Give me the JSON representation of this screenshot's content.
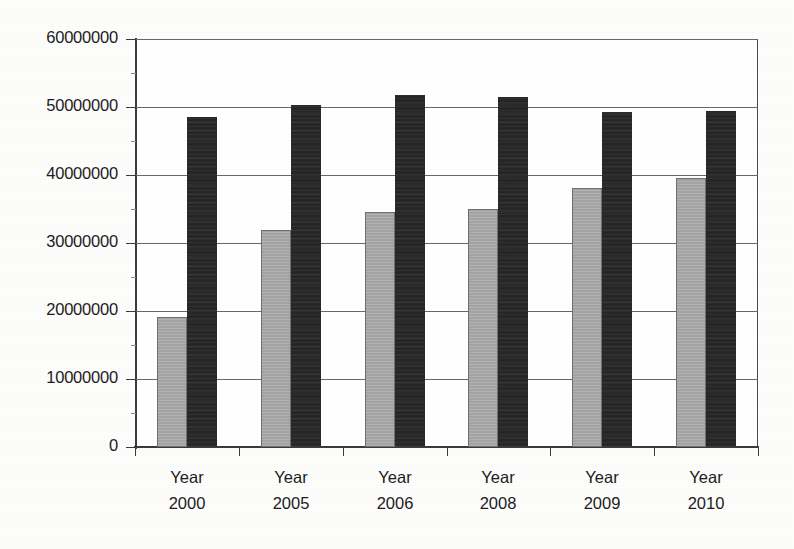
{
  "chart_data": {
    "type": "bar",
    "title": "",
    "subtitle": "",
    "xlabel": "",
    "ylabel": "",
    "categories": [
      "Year 2000",
      "Year 2005",
      "Year 2006",
      "Year 2008",
      "Year 2009",
      "Year 2010"
    ],
    "category_lines": [
      {
        "line1": "Year",
        "line2": "2000"
      },
      {
        "line1": "Year",
        "line2": "2005"
      },
      {
        "line1": "Year",
        "line2": "2006"
      },
      {
        "line1": "Year",
        "line2": "2008"
      },
      {
        "line1": "Year",
        "line2": "2009"
      },
      {
        "line1": "Year",
        "line2": "2010"
      }
    ],
    "series": [
      {
        "name": "series-light",
        "color": "#a9a9a9",
        "values": [
          19100000,
          31900000,
          34600000,
          35000000,
          38100000,
          39600000
        ]
      },
      {
        "name": "series-dark",
        "color": "#262626",
        "values": [
          48500000,
          50300000,
          51800000,
          51500000,
          49200000,
          49400000
        ]
      }
    ],
    "ylim": [
      0,
      60000000
    ],
    "ytick_values": [
      0,
      10000000,
      20000000,
      30000000,
      40000000,
      50000000,
      60000000
    ],
    "ytick_labels": [
      "0",
      "10000000",
      "20000000",
      "30000000",
      "40000000",
      "50000000",
      "60000000"
    ],
    "grid": true,
    "grid_axis": "y",
    "legend": false,
    "legend_position": "none",
    "frame": true,
    "annotations": []
  },
  "colors": {
    "background": "#fdfdfc",
    "plot_background": "#ffffff",
    "axis": "#3b3b3b",
    "gridline": "#686868",
    "text": "#1c1c1c",
    "bar_light": "#a9a9a9",
    "bar_dark": "#262626"
  }
}
